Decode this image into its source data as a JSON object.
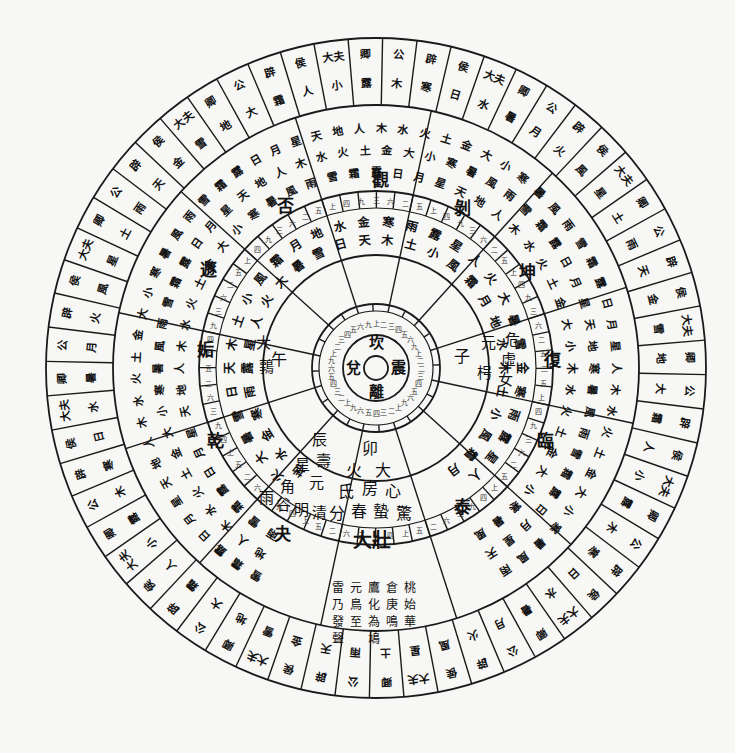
{
  "diagram": {
    "title": "",
    "style": "circular cosmological chart (woodblock print)",
    "colors": {
      "ink": "#111111",
      "paper": "#f7f7f5"
    },
    "hub": {
      "center_glyph": "",
      "inner_ring": [
        "坎",
        "震",
        "離",
        "兌"
      ]
    },
    "numeral_ring": {
      "description": "small counting numerals (一二三…) around inner hub",
      "sample": [
        "二",
        "三",
        "四",
        "五",
        "六",
        "九",
        "上"
      ]
    },
    "branch_ring": {
      "label": "earthly branches",
      "sectors": [
        "子",
        "丑",
        "寅",
        "卯",
        "辰",
        "巳",
        "午",
        "未",
        "申",
        "酉",
        "戌",
        "亥"
      ]
    },
    "mansion_ring": {
      "label": "lunar mansions / solar terms (partial, legible)",
      "cells": [
        {
          "sector": "卯",
          "lines": [
            "卯",
            "火",
            "大"
          ]
        },
        {
          "sector": "卯",
          "lines": [
            "氐",
            "房",
            "心"
          ]
        },
        {
          "sector": "卯",
          "lines": [
            "分",
            "春",
            "蟄",
            "驚"
          ]
        },
        {
          "sector": "辰",
          "lines": [
            "辰",
            "星",
            "壽",
            "角",
            "元"
          ]
        },
        {
          "sector": "辰",
          "lines": [
            "雨",
            "谷",
            "明",
            "清"
          ]
        },
        {
          "sector": "子",
          "lines": [
            "子",
            "元",
            "枵"
          ]
        },
        {
          "sector": "子",
          "lines": [
            "女",
            "虛",
            "危"
          ]
        },
        {
          "sector": "午",
          "lines": [
            "午",
            "大",
            "鶉"
          ]
        }
      ]
    },
    "hexagram_ring": {
      "label": "hexagram names (legible)",
      "items": [
        "大壯",
        "夬",
        "乾",
        "姤",
        "遯",
        "否",
        "觀",
        "剝",
        "坤",
        "復",
        "臨",
        "泰"
      ]
    },
    "outer_ring": {
      "label": "outer cells: ranks of hexagrams (公/辟/侯/大夫/卿)",
      "bottom_cells": [
        "公",
        "辟",
        "侯",
        "大夫",
        "卿",
        "公",
        "辟",
        "大夫",
        "侯",
        "卿",
        "公"
      ],
      "ranks": [
        "公",
        "辟",
        "侯",
        "大夫",
        "卿"
      ],
      "sample_cells": [
        {
          "lines": [
            "大",
            "大",
            "公"
          ]
        },
        {
          "lines": [
            "外",
            "內",
            "侯",
            "需"
          ]
        },
        {
          "lines": [
            "辟",
            "大",
            "壯"
          ]
        },
        {
          "lines": [
            "公",
            "解"
          ]
        },
        {
          "lines": [
            "卿",
            "豫"
          ]
        },
        {
          "lines": [
            "大",
            "夫",
            "隨"
          ]
        },
        {
          "lines": [
            "外",
            "內",
            "侯",
            "晉"
          ]
        },
        {
          "lines": [
            "卿",
            "蠱"
          ]
        }
      ]
    },
    "phenology_text": [
      "雷",
      "乃",
      "發",
      "聲",
      "元",
      "鳥",
      "至",
      "鷹",
      "化",
      "為",
      "鳩",
      "倉",
      "庚",
      "鳴",
      "桃",
      "始",
      "華"
    ]
  }
}
